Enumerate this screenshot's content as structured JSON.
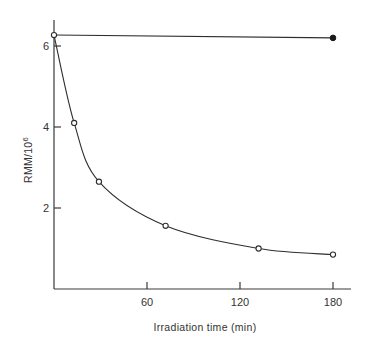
{
  "chart_data": {
    "type": "line",
    "title": "",
    "xlabel": "Irradiation time (min)",
    "ylabel": "RMM/10",
    "ylabel_superscript": "6",
    "xlim": [
      0,
      190
    ],
    "ylim": [
      0,
      6.7
    ],
    "x_ticks": [
      60,
      120,
      180
    ],
    "x_tick_labels": [
      "60",
      "120",
      "180"
    ],
    "y_ticks": [
      2,
      4,
      6
    ],
    "y_tick_labels": [
      "2",
      "4",
      "6"
    ],
    "grid": false,
    "legend": null,
    "series": [
      {
        "name": "filled (control)",
        "marker": "filled-circle",
        "line": "straight",
        "x": [
          0,
          180
        ],
        "y": [
          6.27,
          6.2
        ]
      },
      {
        "name": "open (irradiated)",
        "marker": "open-circle",
        "line": "smooth-fit",
        "x": [
          0,
          13,
          29,
          72,
          132,
          180
        ],
        "y": [
          6.27,
          4.1,
          2.65,
          1.56,
          1.0,
          0.85
        ]
      }
    ]
  }
}
